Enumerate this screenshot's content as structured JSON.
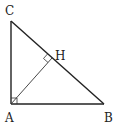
{
  "diagram": {
    "type": "right-triangle-with-altitude",
    "points": {
      "A": {
        "label": "A",
        "x": 11,
        "y": 104
      },
      "B": {
        "label": "B",
        "x": 104,
        "y": 104
      },
      "C": {
        "label": "C",
        "x": 11,
        "y": 21
      },
      "H": {
        "label": "H",
        "x": 52,
        "y": 58
      }
    },
    "segments": [
      "AB",
      "AC",
      "CB",
      "AH"
    ],
    "right_angles": [
      "A",
      "H"
    ],
    "colors": {
      "stroke": "#222222",
      "background": "#ffffff"
    }
  }
}
